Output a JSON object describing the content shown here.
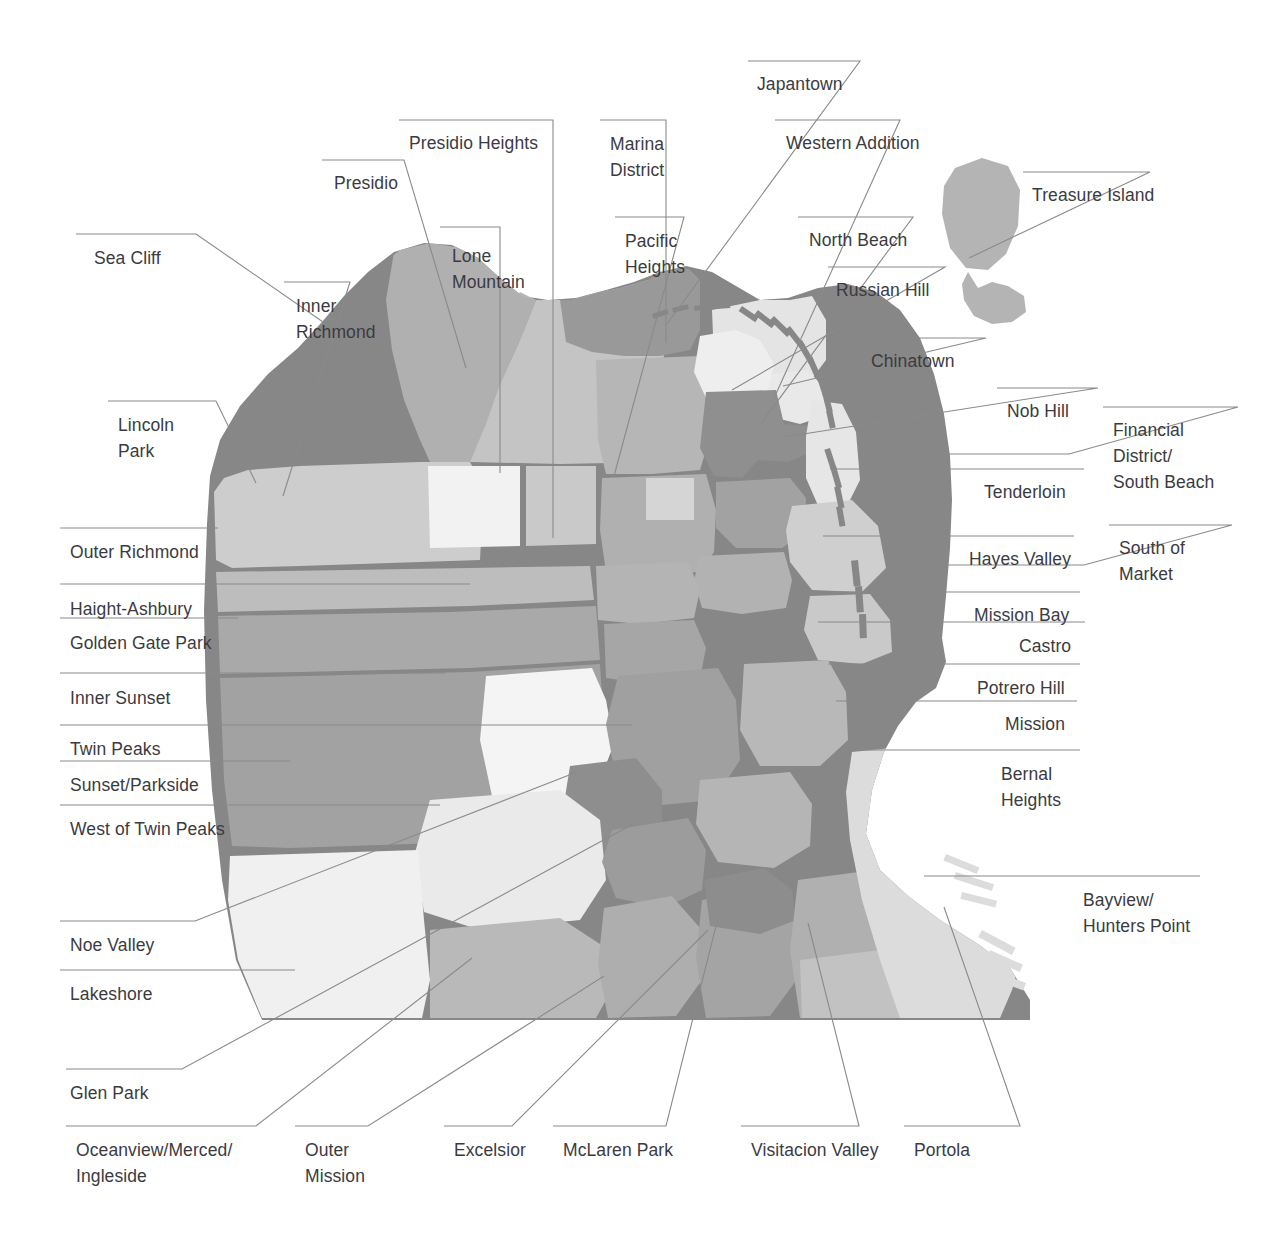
{
  "figure": {
    "kind": "map",
    "region": "San Francisco",
    "background_color": "#ffffff",
    "label_color": "#3b3b3f",
    "leader_line_color": "#8a8a8a"
  },
  "palette": {
    "coast_dark": "#878787",
    "mid_gray": "#a8a8a8",
    "light_gray": "#cdcdcd",
    "pale_gray": "#dedede",
    "very_pale": "#efefef",
    "near_white": "#f7f7f7",
    "island_gray": "#b4b4b4"
  },
  "labels": [
    {
      "id": "sea-cliff",
      "text": "Sea Cliff",
      "x": 94,
      "y": 245,
      "align": "left"
    },
    {
      "id": "presidio",
      "text": "Presidio",
      "x": 334,
      "y": 170,
      "align": "left"
    },
    {
      "id": "presidio-heights",
      "text": "Presidio Heights",
      "x": 409,
      "y": 130,
      "align": "left"
    },
    {
      "id": "lone-mountain",
      "text": "Lone\nMountain",
      "x": 452,
      "y": 243,
      "align": "left"
    },
    {
      "id": "inner-richmond",
      "text": "Inner\nRichmond",
      "x": 296,
      "y": 293,
      "align": "left"
    },
    {
      "id": "marina-district",
      "text": "Marina\nDistrict",
      "x": 610,
      "y": 131,
      "align": "left"
    },
    {
      "id": "pacific-heights",
      "text": "Pacific\nHeights",
      "x": 625,
      "y": 228,
      "align": "left"
    },
    {
      "id": "japantown",
      "text": "Japantown",
      "x": 757,
      "y": 71,
      "align": "left"
    },
    {
      "id": "western-addition",
      "text": "Western Addition",
      "x": 786,
      "y": 130,
      "align": "left"
    },
    {
      "id": "north-beach",
      "text": "North Beach",
      "x": 809,
      "y": 227,
      "align": "left"
    },
    {
      "id": "russian-hill",
      "text": "Russian Hill",
      "x": 836,
      "y": 277,
      "align": "left"
    },
    {
      "id": "chinatown",
      "text": "Chinatown",
      "x": 871,
      "y": 348,
      "align": "left"
    },
    {
      "id": "treasure-island",
      "text": "Treasure Island",
      "x": 1032,
      "y": 182,
      "align": "left"
    },
    {
      "id": "lincoln-park",
      "text": "Lincoln\nPark",
      "x": 118,
      "y": 412,
      "align": "left"
    },
    {
      "id": "nob-hill",
      "text": "Nob Hill",
      "x": 1007,
      "y": 398,
      "align": "left"
    },
    {
      "id": "financial-district-south-beach",
      "text": "Financial\nDistrict/\nSouth Beach",
      "x": 1113,
      "y": 417,
      "align": "left"
    },
    {
      "id": "tenderloin",
      "text": "Tenderloin",
      "x": 984,
      "y": 479,
      "align": "left"
    },
    {
      "id": "outer-richmond",
      "text": "Outer Richmond",
      "x": 70,
      "y": 539,
      "align": "left"
    },
    {
      "id": "hayes-valley",
      "text": "Hayes Valley",
      "x": 969,
      "y": 546,
      "align": "left"
    },
    {
      "id": "south-of-market",
      "text": "South of\nMarket",
      "x": 1119,
      "y": 535,
      "align": "left"
    },
    {
      "id": "haight-ashbury",
      "text": "Haight-Ashbury",
      "x": 70,
      "y": 596,
      "align": "left"
    },
    {
      "id": "golden-gate-park",
      "text": "Golden Gate Park",
      "x": 70,
      "y": 630,
      "align": "left"
    },
    {
      "id": "mission-bay",
      "text": "Mission Bay",
      "x": 974,
      "y": 602,
      "align": "left"
    },
    {
      "id": "castro",
      "text": "Castro",
      "x": 1019,
      "y": 633,
      "align": "left"
    },
    {
      "id": "potrero-hill",
      "text": "Potrero Hill",
      "x": 977,
      "y": 675,
      "align": "left"
    },
    {
      "id": "inner-sunset",
      "text": "Inner Sunset",
      "x": 70,
      "y": 685,
      "align": "left"
    },
    {
      "id": "mission",
      "text": "Mission",
      "x": 1005,
      "y": 711,
      "align": "left"
    },
    {
      "id": "twin-peaks",
      "text": "Twin Peaks",
      "x": 70,
      "y": 736,
      "align": "left"
    },
    {
      "id": "bernal-heights",
      "text": "Bernal\nHeights",
      "x": 1001,
      "y": 761,
      "align": "left"
    },
    {
      "id": "sunset-parkside",
      "text": "Sunset/Parkside",
      "x": 70,
      "y": 772,
      "align": "left"
    },
    {
      "id": "west-of-twin-peaks",
      "text": "West of Twin Peaks",
      "x": 70,
      "y": 816,
      "align": "left"
    },
    {
      "id": "bayview-hunters-point",
      "text": "Bayview/\nHunters Point",
      "x": 1083,
      "y": 887,
      "align": "left"
    },
    {
      "id": "noe-valley",
      "text": "Noe Valley",
      "x": 70,
      "y": 932,
      "align": "left"
    },
    {
      "id": "lakeshore",
      "text": "Lakeshore",
      "x": 70,
      "y": 981,
      "align": "left"
    },
    {
      "id": "glen-park",
      "text": "Glen Park",
      "x": 70,
      "y": 1080,
      "align": "left"
    },
    {
      "id": "oceanview-merced-ingleside",
      "text": "Oceanview/Merced/\nIngleside",
      "x": 76,
      "y": 1137,
      "align": "left"
    },
    {
      "id": "outer-mission",
      "text": "Outer\nMission",
      "x": 305,
      "y": 1137,
      "align": "left"
    },
    {
      "id": "excelsior",
      "text": "Excelsior",
      "x": 454,
      "y": 1137,
      "align": "left"
    },
    {
      "id": "mclaren-park",
      "text": "McLaren Park",
      "x": 563,
      "y": 1137,
      "align": "left"
    },
    {
      "id": "visitacion-valley",
      "text": "Visitacion Valley",
      "x": 751,
      "y": 1137,
      "align": "left"
    },
    {
      "id": "portola",
      "text": "Portola",
      "x": 914,
      "y": 1137,
      "align": "left"
    }
  ],
  "leader_lines": [
    {
      "id": "sea-cliff",
      "points": "76,234 196,234 336,331"
    },
    {
      "id": "presidio",
      "points": "322,160 404,160 466,368"
    },
    {
      "id": "presidio-heights",
      "points": "399,120 553,120 553,538"
    },
    {
      "id": "lone-mountain",
      "points": "440,227 500,227 500,473"
    },
    {
      "id": "inner-richmond",
      "points": "284,282 350,282 283,496"
    },
    {
      "id": "marina-district",
      "points": "600,120 666,120 666,343"
    },
    {
      "id": "pacific-heights",
      "points": "615,217 684,217 614,476"
    },
    {
      "id": "japantown",
      "points": "748,61 860,61 667,324"
    },
    {
      "id": "western-addition",
      "points": "775,120 900,120 775,396"
    },
    {
      "id": "north-beach",
      "points": "798,217 913,217 760,425"
    },
    {
      "id": "russian-hill",
      "points": "828,267 945,267 732,390"
    },
    {
      "id": "chinatown",
      "points": "861,338 986,338 783,386"
    },
    {
      "id": "treasure-island",
      "points": "1023,172 1150,172 969,258"
    },
    {
      "id": "lincoln-park",
      "points": "108,401 216,401 256,483"
    },
    {
      "id": "nob-hill",
      "points": "997,388 1098,388 784,437"
    },
    {
      "id": "financial-district-south-beach",
      "points": "1103,407 1238,407 1069,454 890,454"
    },
    {
      "id": "tenderloin",
      "points": "974,469 1084,469 833,469"
    },
    {
      "id": "outer-richmond",
      "points": "60,528 218,528"
    },
    {
      "id": "hayes-valley",
      "points": "959,536 1074,536 823,536"
    },
    {
      "id": "south-of-market",
      "points": "1109,525 1232,525 1084,565 906,565"
    },
    {
      "id": "haight-ashbury",
      "points": "60,584 470,584"
    },
    {
      "id": "golden-gate-park",
      "points": "60,618 238,618"
    },
    {
      "id": "mission-bay",
      "points": "964,592 1080,592 830,592"
    },
    {
      "id": "castro",
      "points": "1009,622 1085,622 818,622"
    },
    {
      "id": "potrero-hill",
      "points": "967,664 1080,664 828,664"
    },
    {
      "id": "inner-sunset",
      "points": "60,673 445,673"
    },
    {
      "id": "mission",
      "points": "995,701 1077,701 836,701"
    },
    {
      "id": "twin-peaks",
      "points": "60,725 632,725"
    },
    {
      "id": "bernal-heights",
      "points": "991,750 1080,750 854,750"
    },
    {
      "id": "sunset-parkside",
      "points": "60,761 290,761"
    },
    {
      "id": "west-of-twin-peaks",
      "points": "60,805 440,805"
    },
    {
      "id": "bayview-hunters-point",
      "points": "1073,876 1200,876 924,876"
    },
    {
      "id": "noe-valley",
      "points": "60,921 195,921 577,772"
    },
    {
      "id": "lakeshore",
      "points": "60,970 295,970"
    },
    {
      "id": "glen-park",
      "points": "66,1069 182,1069 633,824"
    },
    {
      "id": "oceanview-merced-ingleside",
      "points": "66,1126 256,1126 472,958"
    },
    {
      "id": "outer-mission",
      "points": "295,1126 368,1126 604,976"
    },
    {
      "id": "excelsior",
      "points": "444,1126 512,1126 708,930"
    },
    {
      "id": "mclaren-park",
      "points": "553,1126 666,1126 716,926"
    },
    {
      "id": "visitacion-valley",
      "points": "741,1126 859,1126 808,923"
    },
    {
      "id": "portola",
      "points": "904,1126 1020,1126 944,907"
    }
  ]
}
